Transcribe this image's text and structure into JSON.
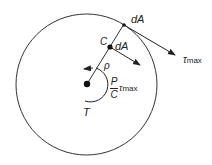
{
  "diagram": {
    "type": "torsion shear stress on circular shaft cross-section",
    "labels": {
      "dA_outer": "dA",
      "dA_inner": "dA",
      "c": "C",
      "rho": "ρ",
      "tau": "τ",
      "tau_sub": "max",
      "frac_num": "P",
      "frac_den": "C",
      "torque": "T"
    },
    "colors": {
      "stroke": "#222222",
      "background": "#ffffff"
    }
  }
}
